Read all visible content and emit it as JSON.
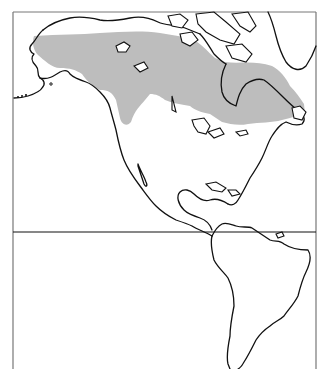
{
  "map": {
    "type": "species range map",
    "region": "The Americas (North, Central, South America)",
    "projection_frame": {
      "left": 13,
      "top": 12,
      "right": 316
    },
    "equator_line_y": 232,
    "colors": {
      "range_fill": "#bdbdbd",
      "coastline": "#111111",
      "frame": "#777777",
      "background": "#ffffff"
    },
    "range": {
      "label": "Distribution range",
      "description": "Boreal belt across Alaska and Canada to the Maritimes"
    }
  }
}
